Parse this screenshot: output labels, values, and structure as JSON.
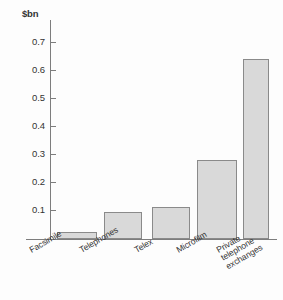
{
  "chart_data": {
    "type": "bar",
    "title": "",
    "subtitle": "",
    "xlabel": "",
    "ylabel": "$bn",
    "unit_label": "$bn",
    "categories": [
      "Facsimile",
      "Telephones",
      "Telex",
      "Microfilm",
      "Private telephone exchanges"
    ],
    "values": [
      0.025,
      0.095,
      0.115,
      0.28,
      0.64
    ],
    "ylim": [
      0,
      0.75
    ],
    "yticks": [
      0.1,
      0.2,
      0.3,
      0.4,
      0.5,
      0.6,
      0.7
    ],
    "ytick_labels": [
      "0.1",
      "0.2",
      "0.3",
      "0.4",
      "0.5",
      "0.6",
      "0.7"
    ],
    "grid": false,
    "legend": null,
    "legend_position": "none",
    "bar_fill_color": "#d9d9d9",
    "bar_border_color": "#8a8a8a",
    "axis_color": "#7d7d7d",
    "background_color": "#fdfdfd",
    "text_color": "#333333",
    "category_label_rotation_deg": -30,
    "category_label_lines": [
      [
        "Facsimile"
      ],
      [
        "Telephones"
      ],
      [
        "Telex"
      ],
      [
        "Microfilm"
      ],
      [
        "Private",
        "telephone",
        "exchanges"
      ]
    ]
  }
}
